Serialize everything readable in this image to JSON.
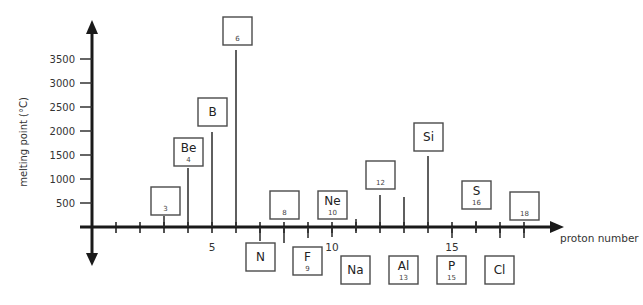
{
  "chart_data": {
    "type": "bar",
    "title": "",
    "xlabel": "proton number",
    "ylabel": "melting point (°C)",
    "ylim": [
      0,
      3500
    ],
    "xlim": [
      0,
      18
    ],
    "grid": false,
    "y_ticks": [
      500,
      1000,
      1500,
      2000,
      2500,
      3000,
      3500
    ],
    "x_tick_labels": [
      {
        "x": 5,
        "label": "5"
      },
      {
        "x": 10,
        "label": "10"
      },
      {
        "x": 15,
        "label": "15"
      }
    ],
    "categories": [
      "Li",
      "Be",
      "B",
      "C",
      "N",
      "O",
      "F",
      "Ne",
      "Na",
      "Mg",
      "Al",
      "Si",
      "P",
      "S",
      "Cl",
      "Ar"
    ],
    "series": [
      {
        "name": "melting point (°C)",
        "points": [
          {
            "z": 3,
            "symbol": "",
            "number_label": "3",
            "value": 180,
            "box": "above"
          },
          {
            "z": 4,
            "symbol": "Be",
            "number_label": "4",
            "value": 1280,
            "box": "above"
          },
          {
            "z": 5,
            "symbol": "B",
            "number_label": "",
            "value": 2080,
            "box": "above"
          },
          {
            "z": 6,
            "symbol": "",
            "number_label": "6",
            "value": 3650,
            "box": "above"
          },
          {
            "z": 7,
            "symbol": "N",
            "number_label": "",
            "value": -210,
            "box": "below"
          },
          {
            "z": 8,
            "symbol": "",
            "number_label": "8",
            "value": -218,
            "box": "above"
          },
          {
            "z": 9,
            "symbol": "F",
            "number_label": "9",
            "value": -220,
            "box": "below"
          },
          {
            "z": 10,
            "symbol": "Ne",
            "number_label": "10",
            "value": -249,
            "box": "above"
          },
          {
            "z": 11,
            "symbol": "Na",
            "number_label": "",
            "value": 98,
            "box": "below"
          },
          {
            "z": 12,
            "symbol": "",
            "number_label": "12",
            "value": 650,
            "box": "above"
          },
          {
            "z": 13,
            "symbol": "Al",
            "number_label": "13",
            "value": 660,
            "box": "below"
          },
          {
            "z": 14,
            "symbol": "Si",
            "number_label": "",
            "value": 1410,
            "box": "above"
          },
          {
            "z": 15,
            "symbol": "P",
            "number_label": "15",
            "value": 44,
            "box": "below"
          },
          {
            "z": 16,
            "symbol": "S",
            "number_label": "16",
            "value": 115,
            "box": "above"
          },
          {
            "z": 17,
            "symbol": "Cl",
            "number_label": "",
            "value": -101,
            "box": "below"
          },
          {
            "z": 18,
            "symbol": "",
            "number_label": "18",
            "value": -189,
            "box": "above"
          }
        ]
      }
    ],
    "annotations": "Each element is shown in a square box (symbol and/or proton number); vertical lines rise from the proton-number axis to the melting point for elements above 0 °C."
  },
  "layout": {
    "origin_px": [
      92,
      227
    ],
    "x_px_per_unit": 24,
    "y_px_per_500": 24,
    "boxes": [
      {
        "z": 3,
        "x": 151,
        "y": 187
      },
      {
        "z": 4,
        "x": 174,
        "y": 138
      },
      {
        "z": 5,
        "x": 198,
        "y": 98
      },
      {
        "z": 6,
        "x": 223,
        "y": 17
      },
      {
        "z": 7,
        "x": 246,
        "y": 243
      },
      {
        "z": 8,
        "x": 270,
        "y": 191
      },
      {
        "z": 9,
        "x": 293,
        "y": 247
      },
      {
        "z": 10,
        "x": 318,
        "y": 191
      },
      {
        "z": 11,
        "x": 341,
        "y": 256
      },
      {
        "z": 12,
        "x": 366,
        "y": 161
      },
      {
        "z": 13,
        "x": 389,
        "y": 256
      },
      {
        "z": 14,
        "x": 414,
        "y": 123
      },
      {
        "z": 15,
        "x": 437,
        "y": 256
      },
      {
        "z": 16,
        "x": 462,
        "y": 181
      },
      {
        "z": 17,
        "x": 485,
        "y": 256
      },
      {
        "z": 18,
        "x": 510,
        "y": 192
      }
    ],
    "stems": [
      {
        "z": 3,
        "y_top": 216,
        "y_bot": 227
      },
      {
        "z": 4,
        "y_top": 168,
        "y_bot": 227
      },
      {
        "z": 5,
        "y_top": 132,
        "y_bot": 227
      },
      {
        "z": 6,
        "y_top": 50,
        "y_bot": 227
      },
      {
        "z": 7,
        "y_top": 227,
        "y_bot": 241
      },
      {
        "z": 8,
        "y_top": 227,
        "y_bot": 243
      },
      {
        "z": 9,
        "y_top": 227,
        "y_bot": 238
      },
      {
        "z": 10,
        "y_top": 227,
        "y_bot": 237
      },
      {
        "z": 11,
        "y_top": 219,
        "y_bot": 231
      },
      {
        "z": 12,
        "y_top": 195,
        "y_bot": 227
      },
      {
        "z": 13,
        "y_top": 197,
        "y_bot": 227
      },
      {
        "z": 14,
        "y_top": 156,
        "y_bot": 227
      },
      {
        "z": 15,
        "y_top": 227,
        "y_bot": 238
      },
      {
        "z": 16,
        "y_top": 221,
        "y_bot": 231
      },
      {
        "z": 17,
        "y_top": 227,
        "y_bot": 238
      },
      {
        "z": 18,
        "y_top": 227,
        "y_bot": 238
      }
    ]
  }
}
